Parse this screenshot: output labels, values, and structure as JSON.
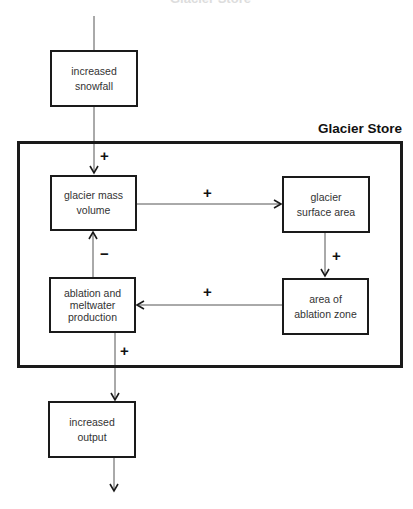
{
  "top_caption": "Glacier Store",
  "store": {
    "label": "Glacier Store"
  },
  "nodes": {
    "snowfall": {
      "line1": "increased",
      "line2": "snowfall"
    },
    "mass": {
      "line1": "glacier mass",
      "line2": "volume"
    },
    "surface": {
      "line1": "glacier",
      "line2": "surface area"
    },
    "ablation_zone": {
      "line1": "area of",
      "line2": "ablation zone"
    },
    "ablation": {
      "line1": "ablation and",
      "line2": "meltwater",
      "line3": "production"
    },
    "output": {
      "line1": "increased",
      "line2": "output"
    }
  },
  "links": {
    "snowfall_to_mass": "+",
    "mass_to_surface": "+",
    "surface_to_zone": "+",
    "zone_to_ablation": "+",
    "ablation_to_mass": "−",
    "ablation_to_output": "+"
  }
}
